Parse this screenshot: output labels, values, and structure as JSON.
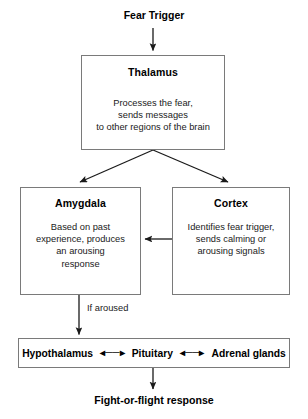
{
  "diagram": {
    "title_text": "Fear Trigger",
    "outcome_text": "Fight-or-flight response",
    "condition_label": "If aroused",
    "colors": {
      "box_border": "#7a7a7a",
      "arrow": "#1a1a1a",
      "text": "#000000",
      "background": "#ffffff"
    },
    "nodes": {
      "thalamus": {
        "title": "Thalamus",
        "line1": "Processes the fear,",
        "line2": "sends messages",
        "line3": "to other regions of the brain"
      },
      "amygdala": {
        "title": "Amygdala",
        "line1": "Based on past",
        "line2": "experience, produces",
        "line3": "an arousing",
        "line4": "response"
      },
      "cortex": {
        "title": "Cortex",
        "line1": "Identifies fear trigger,",
        "line2": "sends calming or",
        "line3": "arousing signals"
      }
    },
    "hpa_axis": {
      "term1": "Hypothalamus",
      "arrow1": "◂──▸",
      "term2": "Pituitary",
      "arrow2": "◂──▸",
      "term3": "Adrenal glands"
    }
  }
}
